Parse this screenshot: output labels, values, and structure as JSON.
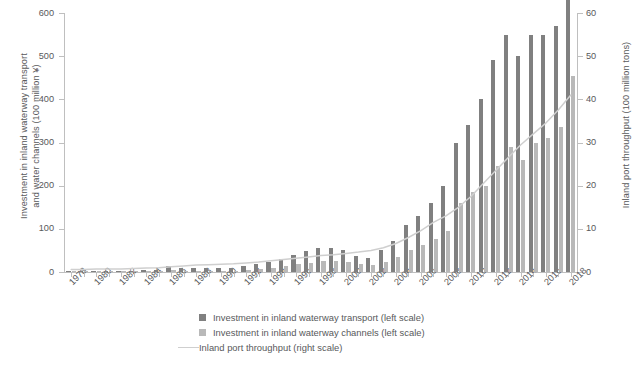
{
  "chart_data": {
    "type": "bar",
    "title": "",
    "xlabel": "",
    "ylabel": "Investment in inland waterway transport\nand water channels (100 million ¥)",
    "y2label": "Inland port throughput (100 million tons)",
    "ylim": [
      0,
      600
    ],
    "y2lim": [
      0,
      60
    ],
    "yticks": [
      0,
      100,
      200,
      300,
      400,
      500,
      600
    ],
    "y2ticks": [
      0,
      10,
      20,
      30,
      40,
      50,
      60
    ],
    "grid": false,
    "legend_position": "bottom",
    "x": [
      1978,
      1979,
      1980,
      1981,
      1982,
      1983,
      1984,
      1985,
      1986,
      1987,
      1988,
      1989,
      1990,
      1991,
      1992,
      1993,
      1994,
      1995,
      1996,
      1997,
      1998,
      1999,
      2000,
      2001,
      2002,
      2003,
      2004,
      2005,
      2006,
      2007,
      2008,
      2009,
      2010,
      2011,
      2012,
      2013,
      2014,
      2015,
      2016,
      2017,
      2018
    ],
    "xtick_labels": [
      "1978",
      "1980",
      "1982",
      "1984",
      "1986",
      "1988",
      "1990",
      "1992",
      "1994",
      "1996",
      "1998",
      "2000",
      "2002",
      "2004",
      "2006",
      "2008",
      "2010",
      "2012",
      "2014",
      "2016",
      "2018"
    ],
    "series": [
      {
        "name": "Investment in inland waterway transport (left scale)",
        "axis": "left",
        "color": "#808080",
        "values": [
          2,
          2,
          2,
          3,
          3,
          3,
          4,
          4,
          14,
          9,
          9,
          9,
          9,
          9,
          14,
          18,
          24,
          31,
          40,
          48,
          55,
          55,
          52,
          38,
          33,
          50,
          72,
          110,
          130,
          160,
          200,
          300,
          340,
          400,
          490,
          550,
          500,
          550,
          550,
          570,
          630
        ]
      },
      {
        "name": "Investment in inland waterway channels (left scale)",
        "axis": "left",
        "color": "#b9b9b9",
        "values": [
          1,
          1,
          1,
          1,
          1,
          1,
          1,
          1,
          5,
          3,
          3,
          3,
          3,
          3,
          5,
          7,
          10,
          14,
          18,
          22,
          26,
          26,
          24,
          18,
          16,
          24,
          34,
          52,
          62,
          76,
          96,
          160,
          185,
          200,
          245,
          290,
          260,
          300,
          310,
          335,
          455
        ]
      },
      {
        "name": "Inland port throughput (right scale)",
        "axis": "right",
        "type": "line",
        "color": "#cfcfcf",
        "values": [
          0.6,
          0.6,
          0.7,
          0.7,
          0.7,
          0.8,
          0.9,
          1.0,
          1.2,
          1.4,
          1.6,
          1.7,
          1.8,
          1.9,
          2.1,
          2.3,
          2.6,
          2.9,
          3.2,
          3.5,
          3.8,
          4.0,
          4.3,
          4.6,
          5.0,
          5.6,
          6.6,
          8.0,
          9.6,
          11.5,
          13.0,
          15.0,
          17.5,
          20.5,
          23.5,
          26.5,
          29.5,
          32.0,
          34.5,
          37.5,
          41.0
        ]
      }
    ]
  },
  "legend": {
    "items": [
      {
        "label": "Investment in inland waterway transport (left scale)",
        "marker": "square-dark"
      },
      {
        "label": "Investment in inland waterway channels (left scale)",
        "marker": "square-light"
      },
      {
        "label": "Inland port throughput (right scale)",
        "marker": "line"
      }
    ]
  }
}
